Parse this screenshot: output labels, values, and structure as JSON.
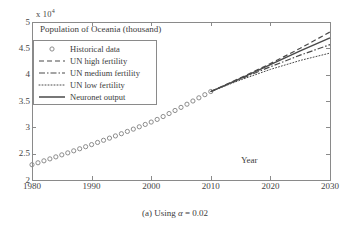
{
  "figure": {
    "caption": "(a) Using α = 0.02",
    "caption_prefix": "(a) Using ",
    "caption_alpha": "α",
    "caption_suffix": " = 0.02"
  },
  "axis": {
    "exponent_prefix": "x 10",
    "exponent_power": "4",
    "xlabel": "Year",
    "ylabel": "",
    "xticks": [
      "1980",
      "1990",
      "2000",
      "2010",
      "2020",
      "2030"
    ],
    "yticks": [
      "2",
      "2.5",
      "3",
      "3.5",
      "4",
      "4.5",
      "5"
    ]
  },
  "colors": {
    "axis": "#8a8a8a",
    "text": "#3c3c3c",
    "data": "#4a4a4a",
    "marker": "#8c8c8c",
    "background": "#ffffff"
  },
  "chart_data": {
    "type": "line",
    "title": "Population of Oceania (thousand)",
    "xlabel": "Year",
    "ylabel": "Population of Oceania (thousand)",
    "y_axis_multiplier": 10000,
    "xlim": [
      1980,
      2030
    ],
    "ylim": [
      20000,
      50000
    ],
    "xticks": [
      1980,
      1990,
      2000,
      2010,
      2020,
      2030
    ],
    "yticks": [
      20000,
      25000,
      30000,
      35000,
      40000,
      45000,
      50000
    ],
    "grid": false,
    "legend_position": "upper left",
    "series": [
      {
        "name": "Historical data",
        "style": "marker-circle",
        "x": [
          1980,
          1981,
          1982,
          1983,
          1984,
          1985,
          1986,
          1987,
          1988,
          1989,
          1990,
          1991,
          1992,
          1993,
          1994,
          1995,
          1996,
          1997,
          1998,
          1999,
          2000,
          2001,
          2002,
          2003,
          2004,
          2005,
          2006,
          2007,
          2008,
          2009,
          2010
        ],
        "values": [
          22900,
          23270,
          23640,
          24010,
          24390,
          24770,
          25150,
          25540,
          25930,
          26320,
          26720,
          27130,
          27540,
          27950,
          28370,
          28790,
          29220,
          29660,
          30100,
          30550,
          31000,
          31500,
          32050,
          32620,
          33200,
          33790,
          34390,
          35000,
          35600,
          36200,
          36800
        ]
      },
      {
        "name": "UN high fertility",
        "style": "dashed",
        "x": [
          2010,
          2015,
          2020,
          2025,
          2030
        ],
        "values": [
          36800,
          39400,
          42100,
          45000,
          48100
        ]
      },
      {
        "name": "UN medium fertility",
        "style": "dash-dot",
        "x": [
          2010,
          2015,
          2020,
          2025,
          2030
        ],
        "values": [
          36800,
          39200,
          41500,
          43700,
          45700
        ]
      },
      {
        "name": "UN low fertility",
        "style": "dotted",
        "x": [
          2010,
          2015,
          2020,
          2025,
          2030
        ],
        "values": [
          36800,
          39000,
          41000,
          42700,
          44100
        ]
      },
      {
        "name": "Neuronet output",
        "style": "solid",
        "x": [
          2010,
          2015,
          2020,
          2025,
          2030
        ],
        "values": [
          36800,
          39300,
          41900,
          44500,
          47000
        ]
      }
    ],
    "legend": [
      {
        "label": "Historical data",
        "style": "marker-circle"
      },
      {
        "label": "UN high fertility",
        "style": "dashed"
      },
      {
        "label": "UN medium fertility",
        "style": "dash-dot"
      },
      {
        "label": "UN low fertility",
        "style": "dotted"
      },
      {
        "label": "Neuronet output",
        "style": "solid"
      }
    ]
  }
}
